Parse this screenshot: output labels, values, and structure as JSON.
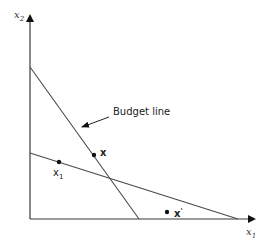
{
  "diagram": {
    "axes": {
      "x_label": "x",
      "x_label_sub": "1",
      "y_label": "x",
      "y_label_sub": "2"
    },
    "annotation": {
      "text": "Budget line",
      "points_to": "steep line"
    },
    "lines": [
      {
        "name": "budget-line",
        "description": "steep downward line from upper y-axis to x-axis"
      },
      {
        "name": "second-line",
        "description": "shallow downward line from mid y-axis to far x-axis"
      }
    ],
    "points": [
      {
        "name": "point-x",
        "label": "x",
        "label_sub": "",
        "on": "budget-line"
      },
      {
        "name": "point-x1",
        "label": "x",
        "label_sub": "1",
        "on": "second-line"
      },
      {
        "name": "point-x-prime",
        "label": "x",
        "label_sup": "'",
        "on": "below both lines"
      }
    ],
    "colors": {
      "axis": "#3a3a3a",
      "line": "#4a4a4a",
      "point": "#111111"
    }
  }
}
